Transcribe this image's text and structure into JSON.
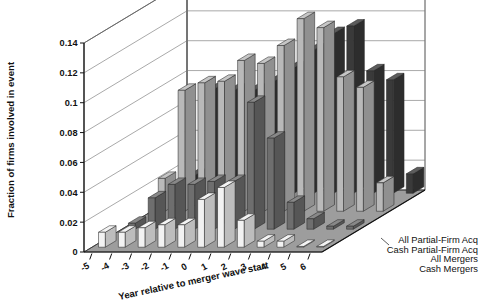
{
  "chart_data": {
    "type": "bar",
    "title": "",
    "xlabel": "Year relative to merger wave start",
    "ylabel": "Fraction of firms involved in event",
    "categories": [
      "-5",
      "-4",
      "-3",
      "-2",
      "-1",
      "0",
      "1",
      "2",
      "3",
      "4",
      "5",
      "6"
    ],
    "ylim": [
      0,
      0.14
    ],
    "yticks": [
      "0",
      "0.02",
      "0.04",
      "0.06",
      "0.08",
      "0.1",
      "0.12",
      "0.14"
    ],
    "ytick_values": [
      0,
      0.02,
      0.04,
      0.06,
      0.08,
      0.1,
      0.12,
      0.14
    ],
    "grid": true,
    "projection": "3d",
    "legend_position": "right-bottom",
    "series": [
      {
        "name": "All Partial-Firm Acq",
        "color": "#3a3a3a",
        "values": [
          0.012,
          0.07,
          0.069,
          0.069,
          0.075,
          0.084,
          0.096,
          0.107,
          0.112,
          0.082,
          0.076,
          0.013
        ]
      },
      {
        "name": "Cash Partial-Firm Acq",
        "color": "#b9b9b9",
        "values": [
          0.022,
          0.081,
          0.086,
          0.087,
          0.101,
          0.099,
          0.111,
          0.129,
          0.123,
          0.09,
          0.083,
          0.019
        ]
      },
      {
        "name": "All Mergers",
        "color": "#6e6e6e",
        "values": [
          0.004,
          0.021,
          0.03,
          0.03,
          0.032,
          0.032,
          0.085,
          0.061,
          0.018,
          0.007,
          0.002,
          0.002
        ]
      },
      {
        "name": "Cash Mergers",
        "color": "#f2f2f2",
        "values": [
          0.01,
          0.01,
          0.013,
          0.015,
          0.015,
          0.032,
          0.04,
          0.018,
          0.004,
          0.004,
          0.0005,
          0.0005
        ]
      }
    ]
  },
  "legend": {
    "entries": [
      {
        "label": "All Partial-Firm Acq"
      },
      {
        "label": "Cash Partial-Firm Acq"
      },
      {
        "label": "All Mergers"
      },
      {
        "label": "Cash Mergers"
      }
    ]
  },
  "colors": {
    "series_dark": "#3a3a3a",
    "series_light_gray": "#b9b9b9",
    "series_mid_gray": "#6e6e6e",
    "series_white": "#f2f2f2",
    "floor": "#9d9d9d",
    "grid": "#7a7a7a",
    "axis": "#111111",
    "background": "#ffffff"
  }
}
